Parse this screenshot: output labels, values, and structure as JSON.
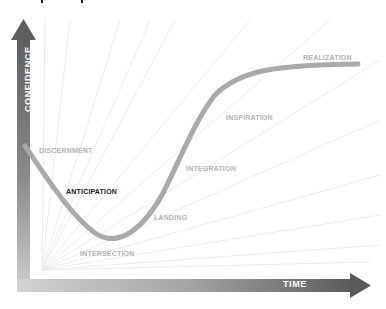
{
  "diagram": {
    "type": "curve-diagram",
    "axes": {
      "y_label": "CONFIDENCE",
      "x_label": "TIME",
      "axis_color": "#6e6e6e",
      "axis_color_light": "#c8c8c8"
    },
    "curve_color": "#a9a9a9",
    "stages": [
      {
        "id": "discernment",
        "label": "DISCERNMENT",
        "highlight": false
      },
      {
        "id": "anticipation",
        "label": "ANTICIPATION",
        "highlight": true
      },
      {
        "id": "intersection",
        "label": "INTERSECTION",
        "highlight": false
      },
      {
        "id": "landing",
        "label": "LANDING",
        "highlight": false
      },
      {
        "id": "integration",
        "label": "INTEGRATION",
        "highlight": false
      },
      {
        "id": "inspiration",
        "label": "INSPIRATION",
        "highlight": false
      },
      {
        "id": "realization",
        "label": "REALIZATION",
        "highlight": false
      }
    ]
  }
}
